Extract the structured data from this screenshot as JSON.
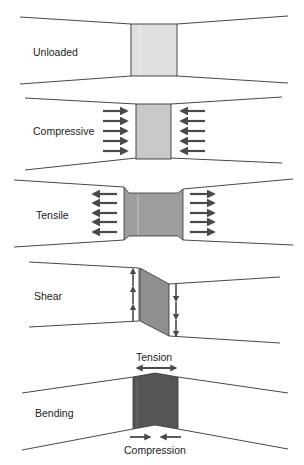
{
  "colors": {
    "outline": "#333333",
    "arrow": "#4a4a4a",
    "unloaded_fill": "#e0e0e0",
    "compressive_fill": "#c8c8c8",
    "tensile_fill": "#9d9d9d",
    "shear_fill": "#8f8f8f",
    "bending_fill": "#555555"
  },
  "panels": [
    {
      "id": "unloaded",
      "label": "Unloaded"
    },
    {
      "id": "compressive",
      "label": "Compressive"
    },
    {
      "id": "tensile",
      "label": "Tensile"
    },
    {
      "id": "shear",
      "label": "Shear"
    },
    {
      "id": "bending",
      "label": "Bending",
      "top_annotation": "Tension",
      "bottom_annotation": "Compression"
    }
  ]
}
